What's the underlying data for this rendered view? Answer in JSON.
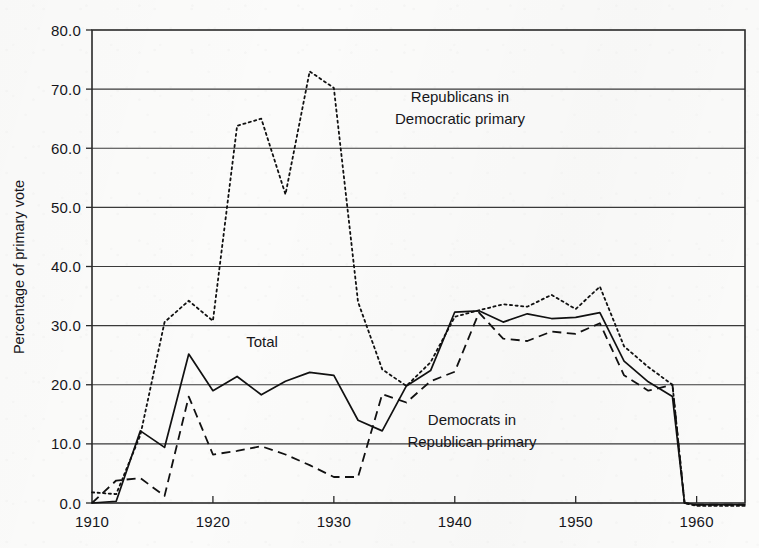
{
  "figure": {
    "title": "",
    "ylabel": "Percentage of primary vote",
    "annotations": [
      {
        "name": "republicans-in-democratic-primary",
        "line1": "Republicans in",
        "line2": "Democratic primary",
        "x": 1946.0,
        "y": 66.0
      },
      {
        "name": "democrats-in-republican-primary",
        "line1": "Democrats in",
        "line2": "Republican primary",
        "x": 1947.0,
        "y": 12.6
      },
      {
        "name": "total",
        "line1": "Total",
        "line2": "",
        "x": 1924.0,
        "y": 27.2
      }
    ]
  },
  "chart_data": {
    "type": "line",
    "title": "",
    "xlabel": "",
    "ylabel": "Percentage of primary vote",
    "xlim": [
      1910,
      1964
    ],
    "ylim": [
      0.0,
      80.0
    ],
    "grid": true,
    "legend": "inline-annotations",
    "xticks": [
      1910,
      1920,
      1930,
      1940,
      1950,
      1960
    ],
    "xticklabels": [
      "1910",
      "1920",
      "1930",
      "1940",
      "1950",
      "1960"
    ],
    "yticks": [
      0.0,
      10.0,
      20.0,
      30.0,
      40.0,
      50.0,
      60.0,
      70.0,
      80.0
    ],
    "yticklabels": [
      "0.0",
      "10.0",
      "20.0",
      "30.0",
      "40.0",
      "50.0",
      "60.0",
      "70.0",
      "80.0"
    ],
    "series": [
      {
        "name": "Total",
        "style": "solid",
        "x": [
          1910,
          1912,
          1914,
          1916,
          1918,
          1920,
          1922,
          1924,
          1926,
          1928,
          1930,
          1932,
          1934,
          1936,
          1938,
          1940,
          1942,
          1944,
          1946,
          1948,
          1950,
          1952,
          1954,
          1956,
          1958,
          1959,
          1960,
          1962,
          1964
        ],
        "values": [
          0.0,
          0.3,
          12.2,
          9.4,
          25.2,
          19.0,
          21.4,
          18.3,
          20.6,
          22.1,
          21.6,
          14.0,
          12.2,
          19.8,
          22.4,
          32.3,
          32.5,
          30.6,
          32.0,
          31.2,
          31.4,
          32.2,
          24.0,
          20.5,
          18.0,
          0.0,
          -0.3,
          -0.3,
          -0.3
        ]
      },
      {
        "name": "Republicans in Democratic primary",
        "style": "dotted",
        "x": [
          1910,
          1912,
          1914,
          1916,
          1918,
          1920,
          1922,
          1924,
          1926,
          1928,
          1930,
          1932,
          1934,
          1936,
          1938,
          1940,
          1942,
          1944,
          1946,
          1948,
          1950,
          1952,
          1954,
          1956,
          1958,
          1959,
          1960,
          1962,
          1964
        ],
        "values": [
          1.8,
          1.5,
          11.5,
          30.6,
          34.2,
          30.8,
          63.8,
          65.0,
          52.2,
          73.0,
          70.2,
          34.0,
          22.6,
          19.8,
          23.8,
          31.5,
          32.6,
          33.6,
          33.2,
          35.2,
          32.8,
          36.6,
          26.5,
          23.0,
          20.0,
          0.0,
          -0.5,
          -0.5,
          -0.5
        ]
      },
      {
        "name": "Democrats in Republican primary",
        "style": "dashed",
        "x": [
          1910,
          1912,
          1914,
          1916,
          1918,
          1920,
          1922,
          1924,
          1926,
          1928,
          1930,
          1932,
          1934,
          1936,
          1938,
          1940,
          1942,
          1944,
          1946,
          1948,
          1950,
          1952,
          1954,
          1956,
          1958,
          1959,
          1960,
          1962,
          1964
        ],
        "values": [
          0.0,
          3.8,
          4.2,
          1.2,
          18.0,
          8.2,
          8.8,
          9.6,
          8.2,
          6.4,
          4.4,
          4.4,
          18.4,
          17.0,
          20.6,
          22.2,
          32.2,
          27.8,
          27.4,
          29.0,
          28.6,
          30.4,
          21.6,
          19.0,
          20.0,
          0.0,
          -0.3,
          -0.3,
          -0.3
        ]
      }
    ]
  }
}
